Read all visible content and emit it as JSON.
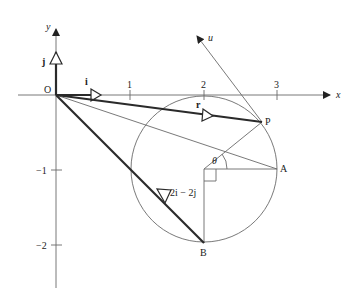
{
  "diagram": {
    "type": "vector-geometry",
    "axes": {
      "x_label": "x",
      "y_label": "y",
      "origin_label": "O",
      "x_ticks": [
        "1",
        "2",
        "3"
      ],
      "y_ticks": [
        "−1",
        "−2"
      ]
    },
    "vectors": {
      "i_label": "i",
      "j_label": "j",
      "r_label": "r",
      "u_label": "u",
      "ob_label": "2i − 2j"
    },
    "points": {
      "P": "P",
      "A": "A",
      "B": "B"
    },
    "angle_label": "θ",
    "circle": {
      "center": [
        2,
        -1
      ],
      "radius": 1
    },
    "coords": {
      "O": [
        0,
        0
      ],
      "A": [
        3,
        -1
      ],
      "B": [
        2,
        -2
      ],
      "P": [
        2.78,
        -0.37
      ]
    }
  }
}
